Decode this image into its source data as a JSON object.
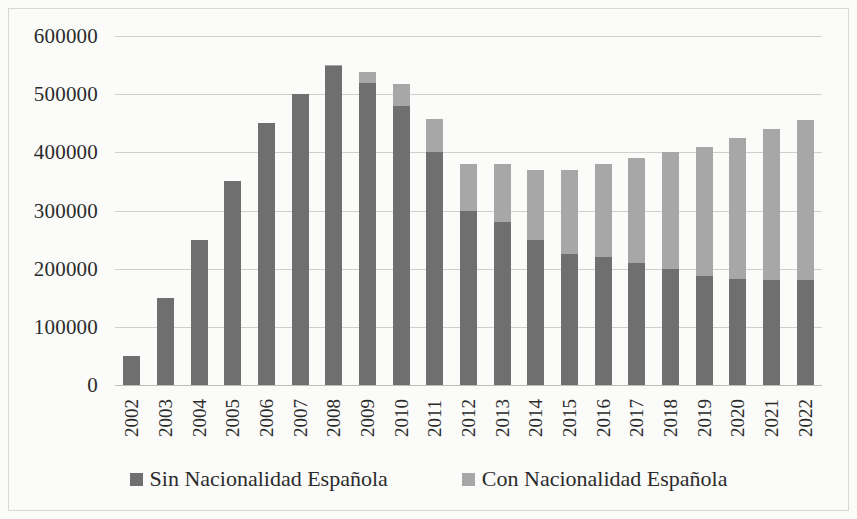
{
  "chart_data": {
    "type": "bar",
    "subtype": "stacked-vertical",
    "title": "",
    "subtitle": "",
    "xlabel": "",
    "ylabel": "",
    "categories": [
      "2002",
      "2003",
      "2004",
      "2005",
      "2006",
      "2007",
      "2008",
      "2009",
      "2010",
      "2011",
      "2012",
      "2013",
      "2014",
      "2015",
      "2016",
      "2017",
      "2018",
      "2019",
      "2020",
      "2021",
      "2022"
    ],
    "series": [
      {
        "name": "Sin Nacionalidad Española",
        "color": "#6f6f6f",
        "values": [
          50000,
          150000,
          250000,
          350000,
          450000,
          500000,
          548000,
          520000,
          480000,
          400000,
          300000,
          280000,
          250000,
          225000,
          220000,
          210000,
          200000,
          188000,
          182000,
          180000,
          180000
        ]
      },
      {
        "name": "Con Nacionalidad Española",
        "color": "#a7a7a7",
        "values": [
          0,
          0,
          0,
          0,
          0,
          0,
          2000,
          18000,
          38000,
          58000,
          80000,
          100000,
          120000,
          145000,
          160000,
          180000,
          200000,
          222000,
          243000,
          260000,
          275000
        ]
      }
    ],
    "totals": [
      50000,
      150000,
      250000,
      350000,
      450000,
      500000,
      550000,
      538000,
      518000,
      458000,
      380000,
      380000,
      370000,
      370000,
      380000,
      390000,
      400000,
      410000,
      425000,
      440000,
      455000
    ],
    "ylim": [
      0,
      600000
    ],
    "y_ticks": [
      0,
      100000,
      200000,
      300000,
      400000,
      500000,
      600000
    ],
    "y_tick_labels": [
      "0",
      "100000",
      "200000",
      "300000",
      "400000",
      "500000",
      "600000"
    ],
    "grid": true,
    "grid_axis": "y",
    "legend_position": "bottom",
    "background_color": "#fbfbfa",
    "gridline_color": "#cfcfcd"
  },
  "legend": {
    "items": [
      {
        "label": "Sin Nacionalidad Española",
        "color": "#6f6f6f",
        "swatch_name": "legend-swatch-sin-nacionalidad"
      },
      {
        "label": "Con Nacionalidad Española",
        "color": "#a7a7a7",
        "swatch_name": "legend-swatch-con-nacionalidad"
      }
    ]
  }
}
